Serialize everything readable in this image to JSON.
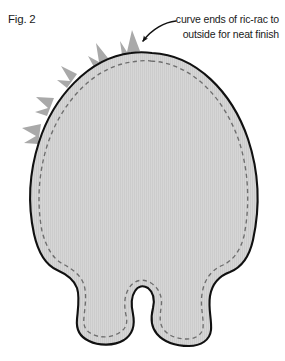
{
  "figure": {
    "label": "Fig. 2",
    "kind": "sewing-pattern-diagram"
  },
  "callout": {
    "line1": "curve ends of ric-rac to",
    "line2": "outside for neat finish",
    "pointer": "curved-arrow"
  },
  "pattern": {
    "body_name": "plush body pattern piece",
    "notch_name": "keyhole notch between feet",
    "stitch_line_name": "dashed stitch line",
    "trim_name": "ric-rac trim"
  },
  "colors": {
    "body_fill": "#d4d4d4",
    "body_outline": "#111111",
    "stitch_dash": "#6e6e6e",
    "ricrac": "#a9a9a9",
    "ricrac_ghost": "#c3c3c3",
    "text": "#1a1a1a",
    "background": "#ffffff"
  }
}
